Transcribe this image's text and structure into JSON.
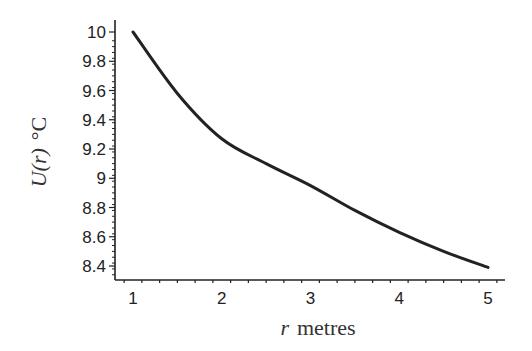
{
  "chart_data": {
    "type": "line",
    "title": "",
    "xlabel": "r metres",
    "ylabel": "U(r) °C",
    "xlabel_parts": {
      "var": "r",
      "unit": "metres"
    },
    "ylabel_parts": {
      "func": "U(r)",
      "unit": "°C"
    },
    "xlim": [
      0.9,
      5.2
    ],
    "ylim": [
      8.33,
      10.1
    ],
    "x_ticks": [
      1,
      2,
      3,
      4,
      5
    ],
    "y_ticks": [
      8.4,
      8.6,
      8.8,
      9,
      9.2,
      9.4,
      9.6,
      9.8,
      10
    ],
    "y_tick_labels": [
      "8.4",
      "8.6",
      "8.8",
      "9",
      "9.2",
      "9.4",
      "9.6",
      "9.8",
      "10"
    ],
    "grid": false,
    "legend": null,
    "series": [
      {
        "name": "U(r)",
        "color": "#222222",
        "x": [
          1,
          1.5,
          2,
          2.5,
          3,
          3.5,
          4,
          4.5,
          5
        ],
        "y": [
          10,
          9.58,
          9.27,
          9.1,
          8.95,
          8.78,
          8.63,
          8.5,
          8.39
        ]
      }
    ]
  }
}
